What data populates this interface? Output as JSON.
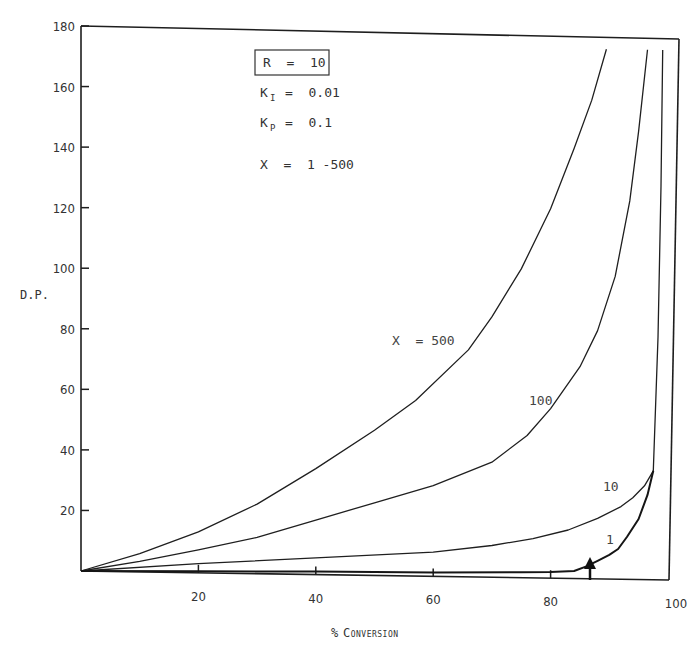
{
  "chart_data": {
    "type": "line",
    "title": "",
    "xlabel": "% Conversion",
    "ylabel": "D.P.",
    "xlim": [
      0,
      100
    ],
    "ylim": [
      0,
      180
    ],
    "x_ticks": [
      20,
      40,
      60,
      80,
      100
    ],
    "y_ticks": [
      20,
      40,
      60,
      80,
      100,
      120,
      140,
      160,
      180
    ],
    "grid": false,
    "legend": "none (curves labeled inline)",
    "annotations": {
      "parameters": [
        "R = 10",
        "K_I = 0.01",
        "K_P = 0.1",
        "X = 1 - 500"
      ],
      "boxed_parameter": "R = 10",
      "arrow_marker_x": 86
    },
    "series": [
      {
        "name": "X = 500",
        "label": "X = 500",
        "points": [
          [
            0,
            0
          ],
          [
            10,
            6
          ],
          [
            20,
            13.5
          ],
          [
            30,
            23
          ],
          [
            40,
            35
          ],
          [
            50,
            48
          ],
          [
            57,
            58
          ],
          [
            66,
            75
          ],
          [
            70,
            86
          ],
          [
            75,
            102
          ],
          [
            80,
            122
          ],
          [
            84,
            142
          ],
          [
            87,
            158
          ],
          [
            89.5,
            175
          ]
        ]
      },
      {
        "name": "X = 100",
        "label": "100",
        "points": [
          [
            0,
            0
          ],
          [
            10,
            3.5
          ],
          [
            20,
            7.6
          ],
          [
            30,
            12
          ],
          [
            40,
            18
          ],
          [
            50,
            24
          ],
          [
            60,
            30
          ],
          [
            70,
            38
          ],
          [
            76,
            47
          ],
          [
            80,
            56
          ],
          [
            85,
            70
          ],
          [
            88,
            82
          ],
          [
            91,
            100
          ],
          [
            93.5,
            125
          ],
          [
            95,
            148
          ],
          [
            96.5,
            175
          ]
        ]
      },
      {
        "name": "X = 10",
        "label": "10",
        "points": [
          [
            0,
            0
          ],
          [
            20,
            3
          ],
          [
            40,
            5.5
          ],
          [
            60,
            8
          ],
          [
            70,
            10.5
          ],
          [
            77,
            13
          ],
          [
            83,
            16
          ],
          [
            88,
            20
          ],
          [
            92,
            24
          ],
          [
            94,
            27
          ],
          [
            96,
            31
          ],
          [
            97.5,
            36
          ],
          [
            98.3,
            80
          ],
          [
            98.8,
            130
          ],
          [
            99.1,
            175
          ]
        ]
      },
      {
        "name": "X = 1",
        "label": "1",
        "points": [
          [
            0,
            0
          ],
          [
            20,
            0.5
          ],
          [
            40,
            1
          ],
          [
            60,
            1.3
          ],
          [
            75,
            1.8
          ],
          [
            80,
            2
          ],
          [
            84,
            2.5
          ],
          [
            86,
            4
          ],
          [
            88,
            6
          ],
          [
            90,
            8
          ],
          [
            91.5,
            10
          ],
          [
            93,
            14
          ],
          [
            95,
            20
          ],
          [
            96.5,
            28
          ],
          [
            97.5,
            36
          ]
        ]
      }
    ]
  },
  "axes": {
    "y_title": "D.P.",
    "x_title_prefix": "%",
    "x_title": "Conversion",
    "y_tick_labels": [
      "20",
      "40",
      "60",
      "80",
      "100",
      "120",
      "140",
      "160",
      "180"
    ],
    "x_tick_labels": [
      "20",
      "40",
      "60",
      "80",
      "100"
    ]
  },
  "params": {
    "r": "R  =  10",
    "ki_sym": "K",
    "ki_sub": "I",
    "ki_val": "=  0.01",
    "kp_sym": "K",
    "kp_sub": "P",
    "kp_val": "=  0.1",
    "x_range": "X  =  1 -500"
  },
  "curve_labels": {
    "x500": "X  = 500",
    "x100": "100",
    "x10": "10",
    "x1": "1"
  }
}
